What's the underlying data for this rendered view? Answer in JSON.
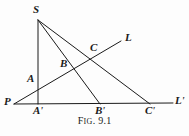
{
  "figure": {
    "caption_prefix_first": "F",
    "caption_prefix_rest": "IG",
    "caption_separator": ".",
    "caption_number": "9.1",
    "caption_full": "Fig. 9.1",
    "background_color": "#fdfdfd",
    "ink_color": "#1a1a1a",
    "width": 189,
    "height": 136
  },
  "points": [
    {
      "id": "S",
      "label": "S",
      "prime": "",
      "x": 38,
      "y": 20,
      "label_x": 33,
      "label_y": 4
    },
    {
      "id": "L",
      "label": "L",
      "prime": "",
      "x": 121,
      "y": 41,
      "label_x": 125,
      "label_y": 32
    },
    {
      "id": "C",
      "label": "C",
      "prime": "",
      "x": 93,
      "y": 55,
      "label_x": 90,
      "label_y": 42
    },
    {
      "id": "B",
      "label": "B",
      "prime": "",
      "x": 68,
      "y": 70,
      "label_x": 60,
      "label_y": 58
    },
    {
      "id": "A",
      "label": "A",
      "prime": "",
      "x": 38,
      "y": 85,
      "label_x": 27,
      "label_y": 73
    },
    {
      "id": "P",
      "label": "P",
      "prime": "",
      "x": 14,
      "y": 104,
      "label_x": 4,
      "label_y": 96
    },
    {
      "id": "Ap",
      "label": "A",
      "prime": "'",
      "x": 38,
      "y": 103,
      "label_x": 33,
      "label_y": 105
    },
    {
      "id": "Bp",
      "label": "B",
      "prime": "'",
      "x": 100,
      "y": 103,
      "label_x": 95,
      "label_y": 105
    },
    {
      "id": "Cp",
      "label": "C",
      "prime": "'",
      "x": 150,
      "y": 103,
      "label_x": 145,
      "label_y": 105
    },
    {
      "id": "Lp",
      "label": "L",
      "prime": "'",
      "x": 173,
      "y": 103,
      "label_x": 175,
      "label_y": 95
    }
  ],
  "segments": [
    {
      "id": "S-Ap",
      "name": "segment-s-to-a-prime",
      "x1": 38,
      "y1": 20,
      "x2": 38,
      "y2": 104
    },
    {
      "id": "S-Bp",
      "name": "segment-s-to-b-prime",
      "x1": 38,
      "y1": 20,
      "x2": 100,
      "y2": 104
    },
    {
      "id": "S-Cp",
      "name": "segment-s-to-c-prime",
      "x1": 38,
      "y1": 20,
      "x2": 150,
      "y2": 104
    },
    {
      "id": "P-L",
      "name": "transversal-p-to-l",
      "x1": 14,
      "y1": 104,
      "x2": 121,
      "y2": 41
    },
    {
      "id": "P-Lp",
      "name": "baseline-p-to-l-prime",
      "x1": 14,
      "y1": 104,
      "x2": 173,
      "y2": 103
    }
  ],
  "meta": {
    "figure_type": "projective-geometry-diagram"
  }
}
